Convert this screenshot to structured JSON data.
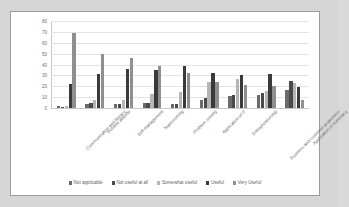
{
  "chart_data": {
    "type": "bar",
    "title": "",
    "subtitle": "",
    "xlabel": "",
    "ylabel": "",
    "ylim": [
      0,
      80
    ],
    "yticks": [
      0,
      10,
      20,
      30,
      40,
      50,
      60,
      70,
      80
    ],
    "grid": true,
    "legend_position": "bottom",
    "categories": [
      "Communication and literacy",
      "Positive attitude",
      "Self-management",
      "Teamworking",
      "Problem solving",
      "Application of IT",
      "Entrepreneurship",
      "Business and customer awareness",
      "Application of numeracy"
    ],
    "series": [
      {
        "name": "Not applicable",
        "color": "#6b6b6b",
        "values": [
          2,
          4,
          4,
          5,
          4,
          7,
          11,
          12,
          17
        ]
      },
      {
        "name": "Not useful at all",
        "color": "#4a4a4a",
        "values": [
          1,
          5,
          4,
          5,
          4,
          9,
          12,
          14,
          25
        ]
      },
      {
        "name": "Somewhat useful",
        "color": "#b5b5b5",
        "values": [
          2,
          7,
          7,
          13,
          15,
          24,
          27,
          16,
          23
        ]
      },
      {
        "name": "Useful",
        "color": "#3a3a3a",
        "values": [
          22,
          31,
          36,
          35,
          39,
          32,
          30,
          31,
          19
        ]
      },
      {
        "name": "Very Useful",
        "color": "#8f8f8f",
        "values": [
          69,
          50,
          46,
          39,
          32,
          24,
          21,
          20,
          7
        ]
      }
    ]
  }
}
